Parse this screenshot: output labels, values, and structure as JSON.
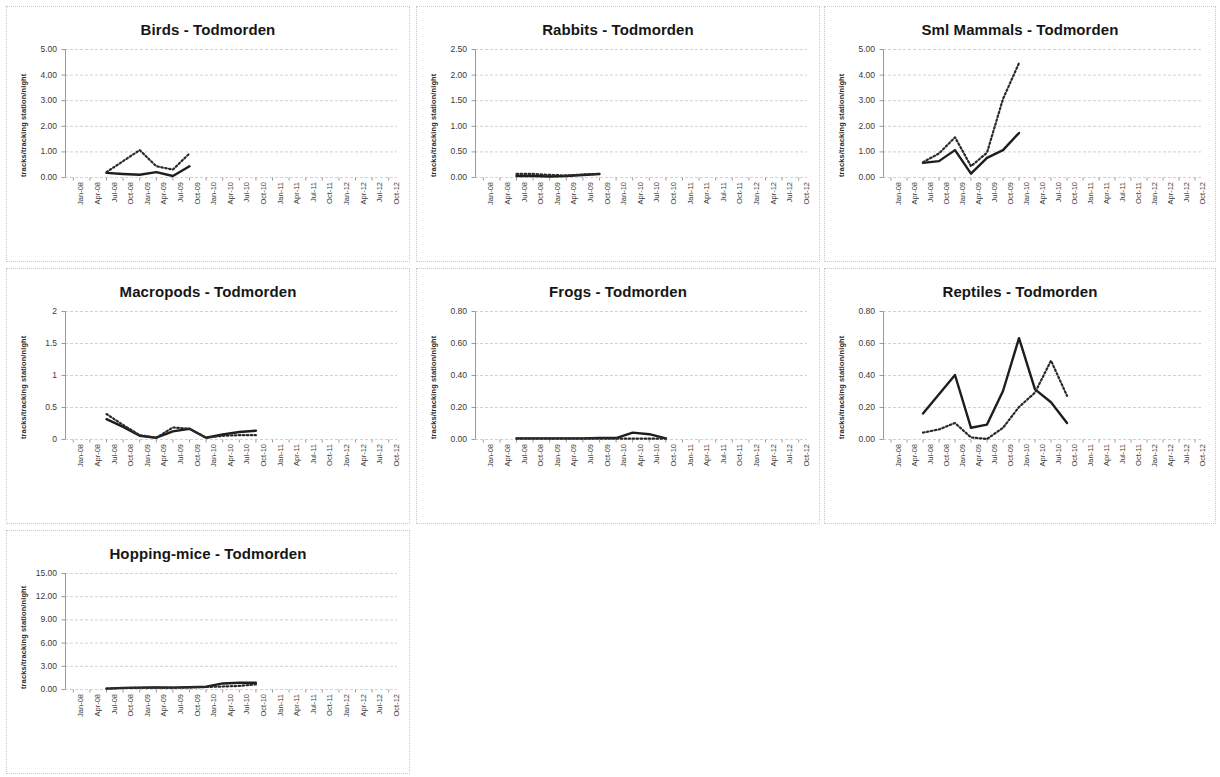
{
  "figure": {
    "site": "Todmorden",
    "y_axis_label": "tracks/tracking station/night",
    "panel_count": 7
  },
  "chart_data": [
    {
      "id": "birds",
      "type": "line",
      "title": "Birds - Todmorden",
      "xlabel": "",
      "ylabel": "tracks/tracking station/night",
      "ylim": [
        0,
        5
      ],
      "yticks": [
        0,
        1,
        2,
        3,
        4,
        5
      ],
      "ytick_labels": [
        "0.00",
        "1.00",
        "2.00",
        "3.00",
        "4.00",
        "5.00"
      ],
      "grid": true,
      "legend": "none",
      "categories": [
        "Jan-08",
        "Apr-08",
        "Jul-08",
        "Oct-08",
        "Jan-09",
        "Apr-09",
        "Jul-09",
        "Oct-09",
        "Jan-10",
        "Apr-10",
        "Jul-10",
        "Oct-10",
        "Jan-11",
        "Apr-11",
        "Jul-11",
        "Oct-11",
        "Jan-12",
        "Apr-12",
        "Jul-12",
        "Oct-12"
      ],
      "series": [
        {
          "name": "solid",
          "style": "solid",
          "x": [
            "Jul-08",
            "Oct-08",
            "Jan-09",
            "Apr-09",
            "Jul-09",
            "Oct-09"
          ],
          "values": [
            0.16,
            0.12,
            0.09,
            0.19,
            0.04,
            0.42
          ]
        },
        {
          "name": "dotted",
          "style": "dotted",
          "x": [
            "Jul-08",
            "Oct-08",
            "Jan-09",
            "Apr-09",
            "Jul-09",
            "Oct-09"
          ],
          "values": [
            0.19,
            0.62,
            1.05,
            0.42,
            0.29,
            0.92
          ]
        }
      ]
    },
    {
      "id": "rabbits",
      "type": "line",
      "title": "Rabbits - Todmorden",
      "xlabel": "",
      "ylabel": "tracks/tracking station/night",
      "ylim": [
        0,
        2.5
      ],
      "yticks": [
        0,
        0.5,
        1.0,
        1.5,
        2.0,
        2.5
      ],
      "ytick_labels": [
        "0.00",
        "0.50",
        "1.00",
        "1.50",
        "2.00",
        "2.50"
      ],
      "grid": true,
      "legend": "none",
      "categories": [
        "Jan-08",
        "Apr-08",
        "Jul-08",
        "Oct-08",
        "Jan-09",
        "Apr-09",
        "Jul-09",
        "Oct-09",
        "Jan-10",
        "Apr-10",
        "Jul-10",
        "Oct-10",
        "Jan-11",
        "Apr-11",
        "Jul-11",
        "Oct-11",
        "Jan-12",
        "Apr-12",
        "Jul-12",
        "Oct-12"
      ],
      "series": [
        {
          "name": "solid",
          "style": "solid",
          "x": [
            "Jul-08",
            "Oct-08",
            "Jan-09",
            "Apr-09",
            "Jul-09",
            "Oct-09"
          ],
          "values": [
            0.02,
            0.02,
            0.01,
            0.02,
            0.04,
            0.06
          ]
        },
        {
          "name": "dotted",
          "style": "dotted",
          "x": [
            "Jul-08",
            "Oct-08",
            "Jan-09",
            "Apr-09",
            "Jul-09",
            "Oct-09"
          ],
          "values": [
            0.06,
            0.06,
            0.04,
            0.03,
            0.05,
            0.06
          ]
        }
      ]
    },
    {
      "id": "sml-mammals",
      "type": "line",
      "title": "Sml Mammals - Todmorden",
      "xlabel": "",
      "ylabel": "tracks/tracking station/night",
      "ylim": [
        0,
        5
      ],
      "yticks": [
        0,
        1,
        2,
        3,
        4,
        5
      ],
      "ytick_labels": [
        "0.00",
        "1.00",
        "2.00",
        "3.00",
        "4.00",
        "5.00"
      ],
      "grid": true,
      "legend": "none",
      "categories": [
        "Jan-08",
        "Apr-08",
        "Jul-08",
        "Oct-08",
        "Jan-09",
        "Apr-09",
        "Jul-09",
        "Oct-09",
        "Jan-10",
        "Apr-10",
        "Jul-10",
        "Oct-10",
        "Jan-11",
        "Apr-11",
        "Jul-11",
        "Oct-11",
        "Jan-12",
        "Apr-12",
        "Jul-12",
        "Oct-12"
      ],
      "series": [
        {
          "name": "solid",
          "style": "solid",
          "x": [
            "Jul-08",
            "Oct-08",
            "Jan-09",
            "Apr-09",
            "Jul-09",
            "Oct-09",
            "Jan-10"
          ],
          "values": [
            0.55,
            0.62,
            1.05,
            0.13,
            0.75,
            1.05,
            1.72
          ]
        },
        {
          "name": "dotted",
          "style": "dotted",
          "x": [
            "Jul-08",
            "Oct-08",
            "Jan-09",
            "Apr-09",
            "Jul-09",
            "Oct-09",
            "Jan-10"
          ],
          "values": [
            0.58,
            0.92,
            1.55,
            0.42,
            0.95,
            3.05,
            4.45
          ]
        }
      ]
    },
    {
      "id": "macropods",
      "type": "line",
      "title": "Macropods - Todmorden",
      "xlabel": "",
      "ylabel": "tracks/tracking station/night",
      "ylim": [
        0,
        2
      ],
      "yticks": [
        0,
        0.5,
        1,
        1.5,
        2
      ],
      "ytick_labels": [
        "0",
        "0.5",
        "1",
        "1.5",
        "2"
      ],
      "grid": true,
      "legend": "none",
      "categories": [
        "Jan-08",
        "Apr-08",
        "Jul-08",
        "Oct-08",
        "Jan-09",
        "Apr-09",
        "Jul-09",
        "Oct-09",
        "Jan-10",
        "Apr-10",
        "Jul-10",
        "Oct-10",
        "Jan-11",
        "Apr-11",
        "Jul-11",
        "Oct-11",
        "Jan-12",
        "Apr-12",
        "Jul-12",
        "Oct-12"
      ],
      "series": [
        {
          "name": "solid",
          "style": "solid",
          "x": [
            "Jul-08",
            "Oct-08",
            "Jan-09",
            "Apr-09",
            "Jul-09",
            "Oct-09",
            "Jan-10",
            "Apr-10",
            "Jul-10",
            "Oct-10"
          ],
          "values": [
            0.31,
            0.19,
            0.05,
            0.02,
            0.12,
            0.16,
            0.02,
            0.07,
            0.11,
            0.13
          ]
        },
        {
          "name": "dotted",
          "style": "dotted",
          "x": [
            "Jul-08",
            "Oct-08",
            "Jan-09",
            "Apr-09",
            "Jul-09",
            "Oct-09",
            "Jan-10",
            "Apr-10",
            "Jul-10",
            "Oct-10"
          ],
          "values": [
            0.39,
            0.22,
            0.06,
            0.02,
            0.18,
            0.16,
            0.02,
            0.05,
            0.06,
            0.06
          ]
        }
      ]
    },
    {
      "id": "frogs",
      "type": "line",
      "title": "Frogs - Todmorden",
      "xlabel": "",
      "ylabel": "tracks/tracking station/night",
      "ylim": [
        0,
        0.8
      ],
      "yticks": [
        0,
        0.2,
        0.4,
        0.6,
        0.8
      ],
      "ytick_labels": [
        "0.00",
        "0.20",
        "0.40",
        "0.60",
        "0.80"
      ],
      "grid": true,
      "legend": "none",
      "categories": [
        "Jan-08",
        "Apr-08",
        "Jul-08",
        "Oct-08",
        "Jan-09",
        "Apr-09",
        "Jul-09",
        "Oct-09",
        "Jan-10",
        "Apr-10",
        "Jul-10",
        "Oct-10",
        "Jan-11",
        "Apr-11",
        "Jul-11",
        "Oct-11",
        "Jan-12",
        "Apr-12",
        "Jul-12",
        "Oct-12"
      ],
      "series": [
        {
          "name": "solid",
          "style": "solid",
          "x": [
            "Jul-08",
            "Oct-08",
            "Jan-09",
            "Apr-09",
            "Jul-09",
            "Oct-09",
            "Jan-10",
            "Apr-10",
            "Jul-10",
            "Oct-10"
          ],
          "values": [
            0.004,
            0.004,
            0.004,
            0.004,
            0.004,
            0.006,
            0.006,
            0.04,
            0.03,
            0.004
          ]
        },
        {
          "name": "dotted",
          "style": "dotted",
          "x": [
            "Jul-08",
            "Oct-08",
            "Jan-09",
            "Apr-09",
            "Jul-09",
            "Oct-09",
            "Jan-10",
            "Apr-10",
            "Jul-10",
            "Oct-10"
          ],
          "values": [
            0.002,
            0.002,
            0.002,
            0.002,
            0.002,
            0.002,
            0.002,
            0.002,
            0.002,
            0.002
          ]
        }
      ]
    },
    {
      "id": "reptiles",
      "type": "line",
      "title": "Reptiles - Todmorden",
      "xlabel": "",
      "ylabel": "tracks/tracking station/night",
      "ylim": [
        0,
        0.8
      ],
      "yticks": [
        0,
        0.2,
        0.4,
        0.6,
        0.8
      ],
      "ytick_labels": [
        "0.00",
        "0.20",
        "0.40",
        "0.60",
        "0.80"
      ],
      "grid": true,
      "legend": "none",
      "categories": [
        "Jan-08",
        "Apr-08",
        "Jul-08",
        "Oct-08",
        "Jan-09",
        "Apr-09",
        "Jul-09",
        "Oct-09",
        "Jan-10",
        "Apr-10",
        "Jul-10",
        "Oct-10",
        "Jan-11",
        "Apr-11",
        "Jul-11",
        "Oct-11",
        "Jan-12",
        "Apr-12",
        "Jul-12",
        "Oct-12"
      ],
      "series": [
        {
          "name": "solid",
          "style": "solid",
          "x": [
            "Jul-08",
            "Oct-08",
            "Jan-09",
            "Apr-09",
            "Jul-09",
            "Oct-09",
            "Jan-10",
            "Apr-10",
            "Jul-10",
            "Oct-10"
          ],
          "values": [
            0.16,
            0.28,
            0.4,
            0.07,
            0.09,
            0.3,
            0.63,
            0.31,
            0.23,
            0.1
          ]
        },
        {
          "name": "dotted",
          "style": "dotted",
          "x": [
            "Jul-08",
            "Oct-08",
            "Jan-09",
            "Apr-09",
            "Jul-09",
            "Oct-09",
            "Jan-10",
            "Apr-10",
            "Jul-10",
            "Oct-10"
          ],
          "values": [
            0.04,
            0.06,
            0.1,
            0.01,
            0.0,
            0.07,
            0.2,
            0.29,
            0.49,
            0.27
          ]
        }
      ]
    },
    {
      "id": "hopping-mice",
      "type": "line",
      "title": "Hopping-mice - Todmorden",
      "xlabel": "",
      "ylabel": "tracks/tracking station/night",
      "ylim": [
        0,
        15
      ],
      "yticks": [
        0,
        3,
        6,
        9,
        12,
        15
      ],
      "ytick_labels": [
        "0.00",
        "3.00",
        "6.00",
        "9.00",
        "12.00",
        "15.00"
      ],
      "grid": true,
      "legend": "none",
      "categories": [
        "Jan-08",
        "Apr-08",
        "Jul-08",
        "Oct-08",
        "Jan-09",
        "Apr-09",
        "Jul-09",
        "Oct-09",
        "Jan-10",
        "Apr-10",
        "Jul-10",
        "Oct-10",
        "Jan-11",
        "Apr-11",
        "Jul-11",
        "Oct-11",
        "Jan-12",
        "Apr-12",
        "Jul-12",
        "Oct-12"
      ],
      "series": [
        {
          "name": "solid",
          "style": "solid",
          "x": [
            "Jul-08",
            "Oct-08",
            "Jan-09",
            "Apr-09",
            "Jul-09",
            "Oct-09",
            "Jan-10",
            "Apr-10",
            "Jul-10",
            "Oct-10"
          ],
          "values": [
            0.05,
            0.15,
            0.18,
            0.2,
            0.18,
            0.22,
            0.3,
            0.72,
            0.8,
            0.8
          ]
        },
        {
          "name": "dotted",
          "style": "dotted",
          "x": [
            "Jul-08",
            "Oct-08",
            "Jan-09",
            "Apr-09",
            "Jul-09",
            "Oct-09",
            "Jan-10",
            "Apr-10",
            "Jul-10",
            "Oct-10"
          ],
          "values": [
            0.05,
            0.12,
            0.16,
            0.18,
            0.18,
            0.22,
            0.26,
            0.32,
            0.4,
            0.6
          ]
        }
      ]
    }
  ]
}
